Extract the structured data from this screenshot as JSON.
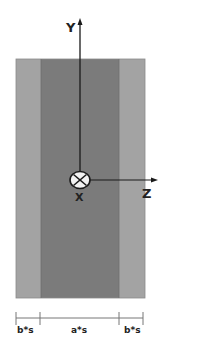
{
  "diagram": {
    "type": "cross-section",
    "axes": {
      "y_label": "Y",
      "z_label": "Z",
      "x_label": "X",
      "x_symbol": "into-page (circle with cross)"
    },
    "regions": [
      {
        "name": "outer-left",
        "color": "#a3a3a3"
      },
      {
        "name": "core",
        "color": "#7b7b7b"
      },
      {
        "name": "outer-right",
        "color": "#a3a3a3"
      }
    ],
    "dimensions": [
      {
        "label": "b*s"
      },
      {
        "label": "a*s"
      },
      {
        "label": "b*s"
      }
    ],
    "colors": {
      "axis": "#1a1a1a",
      "outline": "#6a6a6a",
      "symbol_fill": "#f2f2f2"
    }
  }
}
